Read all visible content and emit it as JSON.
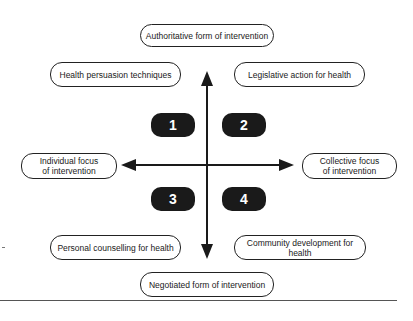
{
  "diagram": {
    "axes": {
      "top": "Authoritative form of intervention",
      "bottom": "Negotiated form of intervention",
      "left": "Individual focus\nof intervention",
      "right": "Collective focus\nof intervention"
    },
    "quadrant_labels": {
      "top_left": "Health persuasion techniques",
      "top_right": "Legislative action for health",
      "bottom_left": "Personal counselling for health",
      "bottom_right": "Community development for health"
    },
    "badges": [
      "1",
      "2",
      "3",
      "4"
    ],
    "colors": {
      "line": "#1a1a1a",
      "badge_fill": "#1a1a1a",
      "badge_text": "#ffffff"
    }
  }
}
